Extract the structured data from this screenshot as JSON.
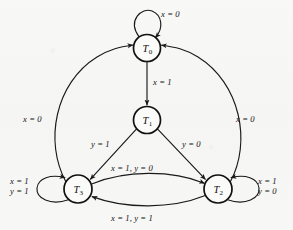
{
  "figure": {
    "kind": "state-transition-diagram",
    "background_color": "#f7f7f6",
    "line_color": "#1a1a1a"
  },
  "states": [
    {
      "id": "T0",
      "name": "T",
      "subscript": "0",
      "label": "T0",
      "cx": 147,
      "cy": 48,
      "r": 13.5
    },
    {
      "id": "T1",
      "name": "T",
      "subscript": "1",
      "label": "T1",
      "cx": 147,
      "cy": 120,
      "r": 13.5
    },
    {
      "id": "T3",
      "name": "T",
      "subscript": "3",
      "label": "T3",
      "cx": 78,
      "cy": 189,
      "r": 14.0
    },
    {
      "id": "T2",
      "name": "T",
      "subscript": "2",
      "label": "T2",
      "cx": 218,
      "cy": 189,
      "r": 14.0
    }
  ],
  "transitions": [
    {
      "id": "t0-self",
      "from": "T0",
      "to": "T0",
      "label": "x = 0",
      "lines": [
        "x = 0"
      ],
      "x": 161,
      "y": 9
    },
    {
      "id": "t0-t1",
      "from": "T0",
      "to": "T1",
      "label": "x = 1",
      "lines": [
        "x = 1"
      ],
      "x": 153,
      "y": 77
    },
    {
      "id": "t1-t3",
      "from": "T1",
      "to": "T3",
      "label": "y = 1",
      "lines": [
        "y = 1"
      ],
      "x": 91,
      "y": 139
    },
    {
      "id": "t1-t2",
      "from": "T1",
      "to": "T2",
      "label": "y = 0",
      "lines": [
        "y = 0"
      ],
      "x": 182,
      "y": 139
    },
    {
      "id": "t3-t2",
      "from": "T3",
      "to": "T2",
      "label": "x = 1, y = 0",
      "lines": [
        "x = 1, y = 0"
      ],
      "x": 111,
      "y": 163
    },
    {
      "id": "t2-t3",
      "from": "T2",
      "to": "T3",
      "label": "x = 1, y = 1",
      "lines": [
        "x = 1, y = 1"
      ],
      "x": 111,
      "y": 213
    },
    {
      "id": "t3-t0",
      "from": "T3",
      "to": "T0",
      "label": "x = 0",
      "lines": [
        "x = 0"
      ],
      "x": 23,
      "y": 114
    },
    {
      "id": "t2-t0",
      "from": "T2",
      "to": "T0",
      "label": "x = 0",
      "lines": [
        "x = 0"
      ],
      "x": 236,
      "y": 114
    },
    {
      "id": "t3-self",
      "from": "T3",
      "to": "T3",
      "label": "x = 1 y = 1",
      "lines": [
        "x = 1",
        "y = 1"
      ],
      "x": 10,
      "y": 177
    },
    {
      "id": "t2-self",
      "from": "T2",
      "to": "T2",
      "label": "x = 1 y = 0",
      "lines": [
        "x = 1",
        "y = 0"
      ],
      "x": 258,
      "y": 177
    }
  ]
}
